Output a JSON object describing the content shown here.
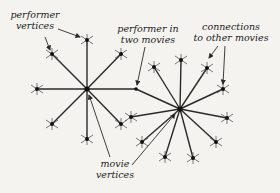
{
  "labels": {
    "performer_vertices": [
      "performer",
      "vertices"
    ],
    "performer_in_two_movies": [
      "performer in",
      "two movies"
    ],
    "connections": [
      "connections",
      "to other movies"
    ],
    "movie_vertices": [
      "movie",
      "vertices"
    ]
  },
  "graph": {
    "movies": [
      {
        "id": "movie-left",
        "x": 87,
        "y": 89
      },
      {
        "id": "movie-right",
        "x": 180,
        "y": 109
      }
    ],
    "shared_performer": {
      "x": 136,
      "y": 89
    },
    "left_performers": [
      [
        87,
        40
      ],
      [
        52,
        54
      ],
      [
        121,
        54
      ],
      [
        37,
        89
      ],
      [
        52,
        124
      ],
      [
        121,
        124
      ],
      [
        87,
        139
      ]
    ],
    "right_performers": [
      [
        154,
        67
      ],
      [
        181,
        60
      ],
      [
        207,
        68
      ],
      [
        223,
        89
      ],
      [
        227,
        118
      ],
      [
        216,
        142
      ],
      [
        193,
        158
      ],
      [
        165,
        157
      ],
      [
        142,
        142
      ],
      [
        131,
        117
      ]
    ]
  }
}
